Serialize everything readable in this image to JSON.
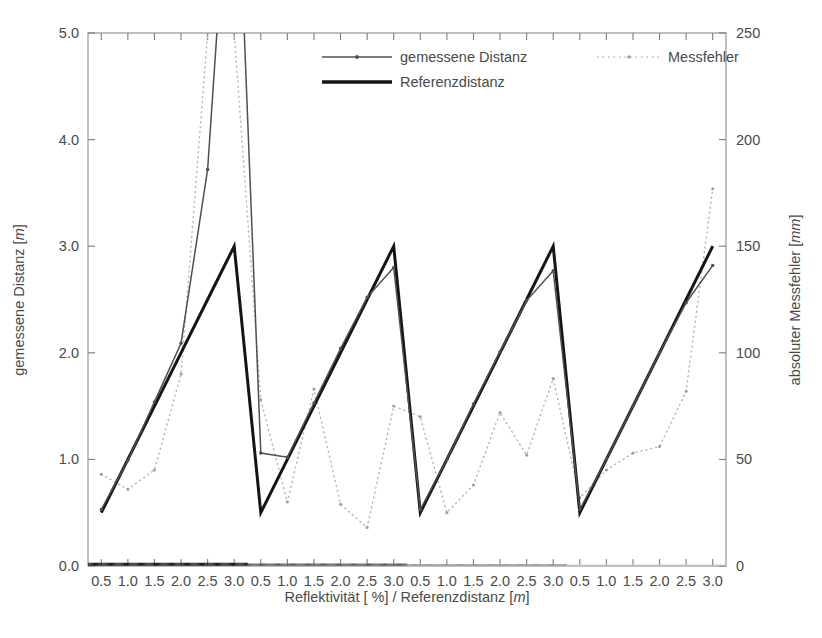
{
  "chart_data": {
    "type": "line",
    "title": "",
    "xlabel": "Reflektivität [ %] / Referenzdistanz [m]",
    "xlabel_plain": "Reflektivität [ %] / Referenzdistanz [",
    "xlabel_italic": "m",
    "xlabel_tail": "]",
    "ylabel_left": "gemessene Distanz [m]",
    "ylabel_left_plain": "gemessene Distanz [",
    "ylabel_left_italic": "m",
    "ylabel_left_tail": "]",
    "ylabel_right": "absoluter Messfehler [mm]",
    "ylabel_right_plain": "absoluter Messfehler [",
    "ylabel_right_italic": "mm",
    "ylabel_right_tail": "]",
    "grid": false,
    "legend_position": "top-center",
    "ylim_left": [
      0.0,
      5.0
    ],
    "ytick_labels_left": [
      "0.0",
      "1.0",
      "2.0",
      "3.0",
      "4.0",
      "5.0"
    ],
    "ytick_values_left": [
      0.0,
      1.0,
      2.0,
      3.0,
      4.0,
      5.0
    ],
    "ylim_right": [
      0,
      250
    ],
    "ytick_labels_right": [
      "0",
      "50",
      "100",
      "150",
      "200",
      "250"
    ],
    "ytick_values_right": [
      0,
      50,
      100,
      150,
      200,
      250
    ],
    "xlim": [
      0,
      24
    ],
    "xtick_labels": [
      "0.5",
      "1.0",
      "1.5",
      "2.0",
      "2.5",
      "3.0",
      "0.5",
      "1.0",
      "1.5",
      "2.0",
      "2.5",
      "3.0",
      "0.5",
      "1.0",
      "1.5",
      "2.0",
      "2.5",
      "3.0",
      "0.5",
      "1.0",
      "1.5",
      "2.0",
      "2.5",
      "3.0"
    ],
    "xtick_values": [
      0.5,
      1.5,
      2.5,
      3.5,
      4.5,
      5.5,
      6.5,
      7.5,
      8.5,
      9.5,
      10.5,
      11.5,
      12.5,
      13.5,
      14.5,
      15.5,
      16.5,
      17.5,
      18.5,
      19.5,
      20.5,
      21.5,
      22.5,
      23.5
    ],
    "reflectivity_groups": [
      "90%",
      "30%",
      "10%",
      "5%"
    ],
    "series": [
      {
        "name": "gemessene Distanz",
        "axis": "left",
        "color": "#4f4f4f",
        "style": "thin-line-with-marker",
        "x": [
          0.5,
          1.5,
          2.5,
          3.5,
          4.5,
          5.5,
          6.5,
          7.5,
          8.5,
          9.5,
          10.5,
          11.5,
          12.5,
          13.5,
          14.5,
          15.5,
          16.5,
          17.5,
          18.5,
          19.5,
          20.5,
          21.5,
          22.5,
          23.5
        ],
        "values": [
          0.53,
          0.99,
          1.54,
          2.09,
          3.72,
          7.4,
          1.06,
          1.02,
          1.53,
          2.04,
          2.52,
          2.8,
          0.53,
          1.0,
          1.52,
          2.01,
          2.49,
          2.77,
          0.53,
          1.0,
          1.5,
          2.0,
          2.47,
          2.82
        ]
      },
      {
        "name": "Referenzdistanz",
        "axis": "left",
        "color": "#151515",
        "style": "thick-line",
        "x": [
          0.5,
          1.5,
          2.5,
          3.5,
          4.5,
          5.5,
          6.5,
          7.5,
          8.5,
          9.5,
          10.5,
          11.5,
          12.5,
          13.5,
          14.5,
          15.5,
          16.5,
          17.5,
          18.5,
          19.5,
          20.5,
          21.5,
          22.5,
          23.5
        ],
        "values": [
          0.5,
          1.0,
          1.5,
          2.0,
          2.5,
          3.0,
          0.5,
          1.0,
          1.5,
          2.0,
          2.5,
          3.0,
          0.5,
          1.0,
          1.5,
          2.0,
          2.5,
          3.0,
          0.5,
          1.0,
          1.5,
          2.0,
          2.5,
          3.0
        ]
      },
      {
        "name": "Messfehler",
        "axis": "right",
        "color": "#b9b9b9",
        "style": "dotted",
        "x": [
          0.5,
          1.5,
          2.5,
          3.5,
          4.5,
          5.5,
          6.5,
          7.5,
          8.5,
          9.5,
          10.5,
          11.5,
          12.5,
          13.5,
          14.5,
          15.5,
          16.5,
          17.5,
          18.5,
          19.5,
          20.5,
          21.5,
          22.5,
          23.5
        ],
        "values": [
          43,
          36,
          45,
          90,
          250,
          250,
          78,
          30,
          83,
          29,
          18,
          75,
          70,
          25,
          38,
          72,
          52,
          88,
          32,
          45,
          53,
          56,
          82,
          177
        ]
      }
    ],
    "baseline_dense_dots": {
      "note": "dense near-zero dotted scatter along the bottom axis",
      "value": 0,
      "group_shades": [
        "#1b1b1b",
        "#5a5a5a",
        "#9a9a9a",
        "#cacaca"
      ]
    }
  },
  "legend": {
    "items": [
      {
        "label": "gemessene Distanz",
        "marker": "thin-line-with-marker",
        "color": "#4f4f4f"
      },
      {
        "label": "Referenzdistanz",
        "marker": "thick-line",
        "color": "#151515"
      },
      {
        "label": "Messfehler",
        "marker": "dotted",
        "color": "#b9b9b9"
      }
    ]
  }
}
